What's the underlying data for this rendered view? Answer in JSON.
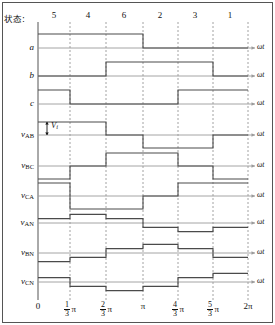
{
  "header": {
    "state_label": "状态:",
    "states": [
      {
        "num": "5",
        "x": 54
      },
      {
        "num": "4",
        "x": 88
      },
      {
        "num": "6",
        "x": 124
      },
      {
        "num": "2",
        "x": 160
      },
      {
        "num": "3",
        "x": 195
      },
      {
        "num": "1",
        "x": 230
      }
    ]
  },
  "axis": {
    "omega_t": "ωt",
    "x_origin": 38,
    "x_end": 255,
    "ticks": [
      {
        "label": "0",
        "type": "plain",
        "x": 38
      },
      {
        "label": "π/3",
        "type": "frac",
        "num": "1",
        "den": "3",
        "x": 70
      },
      {
        "label": "2π/3",
        "type": "frac",
        "num": "2",
        "den": "3",
        "x": 106
      },
      {
        "label": "π",
        "type": "plain",
        "x": 143
      },
      {
        "label": "4π/3",
        "type": "frac",
        "num": "4",
        "den": "3",
        "x": 178
      },
      {
        "label": "5π/3",
        "type": "frac",
        "num": "5",
        "den": "3",
        "x": 213
      },
      {
        "label": "2π",
        "type": "plain",
        "x": 248
      }
    ]
  },
  "annotation": {
    "vi_label": "V",
    "vi_sub": "i"
  },
  "chart_data": {
    "type": "line",
    "xlabel": "ωt",
    "ylabel": "",
    "xlim": [
      0,
      6.283185
    ],
    "grid": true,
    "x_tick_values": [
      0,
      1.047198,
      2.094395,
      3.141593,
      4.18879,
      5.235988,
      6.283185
    ],
    "x_tick_labels": [
      "0",
      "1/3 π",
      "2/3 π",
      "π",
      "4/3 π",
      "5/3 π",
      "2π"
    ],
    "sector_labels": [
      "5",
      "4",
      "6",
      "2",
      "3",
      "1"
    ],
    "series": [
      {
        "name": "a",
        "label": "a",
        "sub": "",
        "kind": "logic",
        "row_y": 48,
        "amp_px": 14,
        "levels": [
          1,
          1,
          1,
          0,
          0,
          0
        ],
        "segments": [
          {
            "from": 0,
            "to": 3,
            "value": 1
          },
          {
            "from": 3,
            "to": 6,
            "value": 0
          }
        ]
      },
      {
        "name": "b",
        "label": "b",
        "sub": "",
        "kind": "logic",
        "row_y": 76,
        "amp_px": 14,
        "levels": [
          0,
          0,
          1,
          1,
          1,
          0
        ],
        "segments": [
          {
            "from": 0,
            "to": 2,
            "value": 0
          },
          {
            "from": 2,
            "to": 5,
            "value": 1
          },
          {
            "from": 5,
            "to": 6,
            "value": 0
          }
        ]
      },
      {
        "name": "c",
        "label": "c",
        "sub": "",
        "kind": "logic",
        "row_y": 104,
        "amp_px": 14,
        "levels": [
          1,
          0,
          0,
          0,
          1,
          1
        ],
        "segments": [
          {
            "from": 0,
            "to": 1,
            "value": 1
          },
          {
            "from": 1,
            "to": 4,
            "value": 0
          },
          {
            "from": 4,
            "to": 6,
            "value": 1
          }
        ]
      },
      {
        "name": "v_AB",
        "label": "v",
        "sub": "AB",
        "kind": "line-voltage",
        "row_y": 135,
        "amp_px": 13,
        "levels": [
          1,
          1,
          0,
          -1,
          -1,
          0
        ],
        "unit": "V_i"
      },
      {
        "name": "v_BC",
        "label": "v",
        "sub": "BC",
        "kind": "line-voltage",
        "row_y": 166,
        "amp_px": 13,
        "levels": [
          -1,
          0,
          1,
          1,
          0,
          -1
        ],
        "unit": "V_i"
      },
      {
        "name": "v_CA",
        "label": "v",
        "sub": "CA",
        "kind": "line-voltage",
        "row_y": 196,
        "amp_px": 13,
        "levels": [
          1,
          -1,
          -1,
          0,
          1,
          1
        ],
        "unit": "V_i"
      },
      {
        "name": "v_AN",
        "label": "v",
        "sub": "AN",
        "kind": "phase-voltage",
        "row_y": 223,
        "amp_px": 13,
        "levels": [
          0.3333,
          0.6667,
          0.3333,
          -0.3333,
          -0.6667,
          -0.3333
        ],
        "unit": "V_i"
      },
      {
        "name": "v_BN",
        "label": "v",
        "sub": "BN",
        "kind": "phase-voltage",
        "row_y": 253,
        "amp_px": 13,
        "levels": [
          -0.6667,
          -0.3333,
          0.3333,
          0.6667,
          0.3333,
          -0.3333
        ],
        "unit": "V_i"
      },
      {
        "name": "v_CN",
        "label": "v",
        "sub": "CN",
        "kind": "phase-voltage",
        "row_y": 282,
        "amp_px": 13,
        "levels": [
          0.3333,
          -0.3333,
          -0.6667,
          -0.3333,
          0.3333,
          0.6667
        ],
        "unit": "V_i"
      }
    ]
  },
  "colors": {
    "waveform": "#4a4a4a",
    "baseline": "#9a9a9a",
    "gridline": "#8a8a8a",
    "frame": "#555555",
    "text": "#111111"
  }
}
